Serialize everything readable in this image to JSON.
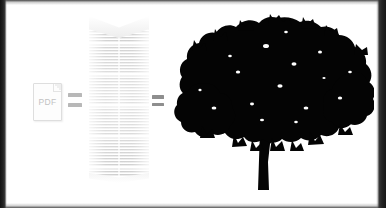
{
  "scene": {
    "title": "PDF equals stack of paper equals tree",
    "background_color": "#ffffff",
    "border_color": "#1c1c1c",
    "width": 386,
    "height": 208
  },
  "equation": {
    "items": [
      {
        "id": "pdf-document",
        "kind": "document-icon",
        "label": "PDF",
        "color": "#c2c2c2",
        "border_color": "#dedede"
      },
      {
        "id": "equals-1",
        "kind": "equals-sign",
        "label": "=",
        "color": "#b8b8b8"
      },
      {
        "id": "paper-stack",
        "kind": "paper-stack-illustration",
        "label": "stack of printed paper",
        "color": "#b0b0b0"
      },
      {
        "id": "equals-2",
        "kind": "equals-sign",
        "label": "=",
        "color": "#8e8e8e"
      },
      {
        "id": "tree",
        "kind": "tree-silhouette",
        "label": "tree",
        "color": "#000000"
      }
    ]
  },
  "pdf_icon": {
    "label": "PDF"
  },
  "equals_first": {
    "label": "="
  },
  "equals_second": {
    "label": "="
  },
  "paper_stack": {
    "label": "stack of paper"
  },
  "tree": {
    "label": "tree silhouette"
  }
}
